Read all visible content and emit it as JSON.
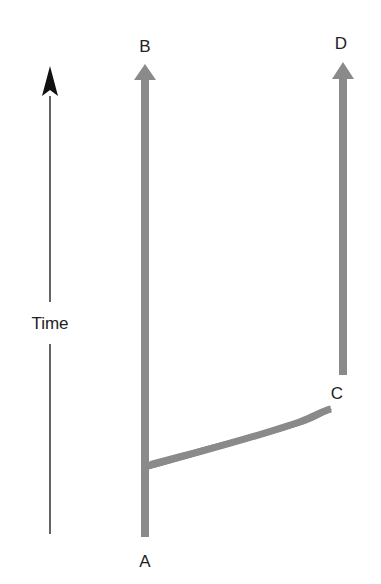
{
  "diagram": {
    "type": "phylogeny-branching",
    "colors": {
      "lineage": "#8a8a8a",
      "axis": "#111111",
      "text": "#222222"
    },
    "time_axis": {
      "label": "Time",
      "direction": "up"
    },
    "nodes": {
      "A": {
        "label": "A",
        "role": "ancestor (bottom of main lineage)"
      },
      "B": {
        "label": "B",
        "role": "tip of main lineage"
      },
      "C": {
        "label": "C",
        "role": "start of side lineage"
      },
      "D": {
        "label": "D",
        "role": "tip of side lineage"
      }
    },
    "edges": [
      {
        "from": "A",
        "to": "B",
        "style": "thick gray arrow"
      },
      {
        "from": "A",
        "to": "C",
        "style": "thick gray branch (curved)"
      },
      {
        "from": "C",
        "to": "D",
        "style": "thick gray arrow"
      }
    ]
  }
}
